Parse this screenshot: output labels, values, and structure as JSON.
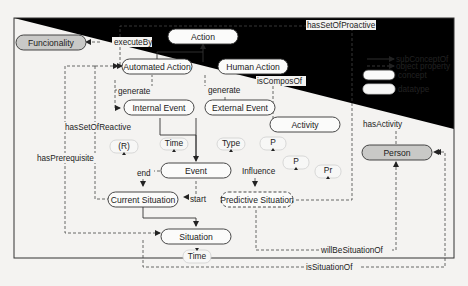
{
  "diagram": {
    "nodes": {
      "funcionality": "Funcionality",
      "action": "Action",
      "automated_action": "Automated Action",
      "human_action": "Human Action",
      "internal_event": "Internal Event",
      "external_event": "External Event",
      "activity": "Activity",
      "event": "Event",
      "current_situation": "Current Situation",
      "predictive_situation": "Predictive Situation",
      "situation": "Situation",
      "person": "Person"
    },
    "datatypes": {
      "time1": "Time",
      "type": "Type",
      "p1": "P",
      "r": "(R)",
      "p2": "P",
      "pr": "Pr",
      "time2": "Time"
    },
    "edges": {
      "execute_by": "executeBy",
      "has_set_of_proactive": "hasSetOfProactive",
      "generate1": "generate",
      "generate2": "generate",
      "is_compos_of": "isComposOf",
      "has_activity": "hasActivity",
      "has_set_of_reactive": "hasSetOfReactive",
      "has_prerequisite": "hasPrerequisite",
      "end": "end",
      "start": "start",
      "influence": "Influence",
      "will_be_situation_of": "willBeSituationOf",
      "is_situation_of": "isSituationOf"
    },
    "legend": {
      "sub_concept_of": "subConceptOf",
      "object_property": "object property",
      "concept": "concept",
      "datatype": "datatype"
    }
  }
}
